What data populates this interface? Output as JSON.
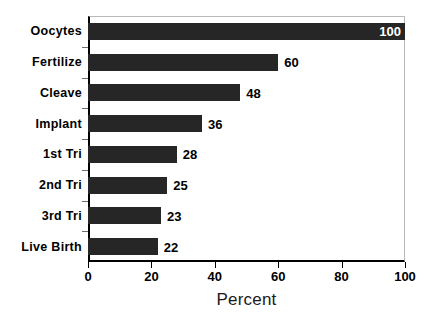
{
  "chart_data": {
    "type": "bar",
    "orientation": "horizontal",
    "title": "",
    "xlabel": "Percent",
    "ylabel": "",
    "xlim": [
      0,
      100
    ],
    "xticks": [
      0,
      20,
      40,
      60,
      80,
      100
    ],
    "xtick_labels": [
      "0",
      "20",
      "40",
      "60",
      "80",
      "100"
    ],
    "grid": false,
    "legend": false,
    "categories": [
      "Oocytes",
      "Fertilize",
      "Cleave",
      "Implant",
      "1st Tri",
      "2nd Tri",
      "3rd Tri",
      "Live Birth"
    ],
    "values": [
      100,
      60,
      48,
      36,
      28,
      25,
      23,
      22
    ],
    "value_labels": [
      "100",
      "60",
      "48",
      "36",
      "28",
      "25",
      "23",
      "22"
    ],
    "bar_color": "#262626",
    "label_color_inside": "#ffffff",
    "label_color_outside": "#000000",
    "axis_color": "#000000",
    "frame_color": "#b9b9b9",
    "background": "#ffffff"
  }
}
